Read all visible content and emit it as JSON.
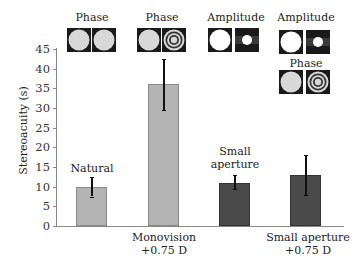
{
  "chart_data": {
    "type": "bar",
    "title": "",
    "xlabel": "",
    "ylabel": "Stereoacuity (s)",
    "ylim": [
      0,
      45
    ],
    "yticks": [
      0,
      5,
      10,
      15,
      20,
      25,
      30,
      35,
      40,
      45
    ],
    "grid": false,
    "categories": [
      "Natural",
      "Monovision +0.75 D",
      "Small aperture",
      "Small aperture +0.75 D"
    ],
    "values": [
      10,
      36,
      11,
      13
    ],
    "error_low": [
      7.5,
      29.5,
      9.5,
      8
    ],
    "error_high": [
      12.5,
      42.5,
      13,
      18
    ],
    "bar_colors": [
      "#b4b4b4",
      "#b4b4b4",
      "#4a4a4a",
      "#4a4a4a"
    ],
    "annotations": [
      {
        "category": "Natural",
        "text": "Phase",
        "icons": [
          "phase-plain",
          "phase-plain"
        ]
      },
      {
        "category": "Monovision +0.75 D",
        "text": "Phase",
        "icons": [
          "phase-plain",
          "phase-rings"
        ]
      },
      {
        "category": "Small aperture",
        "text": "Amplitude",
        "icons": [
          "amplitude-large",
          "amplitude-small"
        ]
      },
      {
        "category": "Small aperture +0.75 D",
        "text": "Amplitude / Phase",
        "icons": [
          "amplitude-large",
          "amplitude-small",
          "phase-plain",
          "phase-rings"
        ]
      }
    ]
  },
  "axis": {
    "ylabel": "Stereoacuity (s)",
    "ticks": [
      "0",
      "5",
      "10",
      "15",
      "20",
      "25",
      "30",
      "35",
      "40",
      "45"
    ]
  },
  "bars": [
    {
      "bar_label": "Natural",
      "axis_label_1": "",
      "axis_label_2": "",
      "value": 10,
      "lo": 7.5,
      "hi": 12.5,
      "color": "#b4b4b4"
    },
    {
      "bar_label": "",
      "axis_label_1": "Monovision",
      "axis_label_2": "+0.75 D",
      "value": 36,
      "lo": 29.5,
      "hi": 42.5,
      "color": "#b4b4b4"
    },
    {
      "bar_label_1": "Small",
      "bar_label_2": "aperture",
      "axis_label_1": "",
      "axis_label_2": "",
      "value": 11,
      "lo": 9.5,
      "hi": 13,
      "color": "#4a4a4a"
    },
    {
      "bar_label": "",
      "axis_label_1": "Small aperture",
      "axis_label_2": "+0.75 D",
      "value": 13,
      "lo": 8,
      "hi": 18,
      "color": "#4a4a4a"
    }
  ],
  "icon_groups": [
    {
      "title": "Phase"
    },
    {
      "title": "Phase"
    },
    {
      "title": "Amplitude"
    },
    {
      "title": "Amplitude",
      "subtitle": "Phase"
    }
  ]
}
